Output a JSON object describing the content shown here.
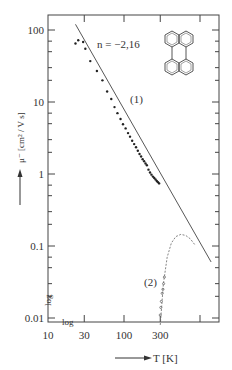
{
  "chart_data": {
    "type": "scatter",
    "title": "",
    "xlabel": "T [K]",
    "ylabel": "μ⁻ [cm² / V s]",
    "xscale": "log",
    "yscale": "log",
    "xlim": [
      10,
      1500
    ],
    "ylim": [
      0.006,
      180
    ],
    "x_ticks": [
      10,
      30,
      100,
      300
    ],
    "x_tick_labels": [
      "10",
      "30",
      "100",
      "300"
    ],
    "y_ticks": [
      0.01,
      0.1,
      1,
      10,
      100
    ],
    "y_tick_labels": [
      "0.01",
      "0.1",
      "1",
      "10",
      "100"
    ],
    "x_axis_tag": "log",
    "y_axis_tag": "log",
    "grid": false,
    "annotations": [
      {
        "text": "n = −2,16",
        "note": "power-law fit exponent"
      },
      {
        "text": "(1)",
        "note": "series 1 label"
      },
      {
        "text": "(2)",
        "note": "series 2 label"
      },
      {
        "text": "perylene structure",
        "note": "molecular structure inset, top right"
      }
    ],
    "series": [
      {
        "name": "(1)",
        "marker": "filled-dot",
        "x": [
          23,
          25,
          29,
          31,
          36,
          44,
          52,
          60,
          68,
          75,
          82,
          90,
          97,
          105,
          113,
          120,
          128,
          136,
          144,
          152,
          160,
          168,
          176,
          184,
          192,
          200,
          210,
          220,
          230,
          240,
          250,
          260,
          270,
          280,
          290
        ],
        "y": [
          65,
          72,
          68,
          55,
          37,
          27,
          20,
          14,
          11,
          8.5,
          7,
          5.8,
          4.9,
          4.3,
          3.7,
          3.3,
          2.9,
          2.6,
          2.35,
          2.1,
          1.9,
          1.75,
          1.6,
          1.5,
          1.4,
          1.32,
          1.15,
          1.05,
          0.98,
          0.92,
          0.88,
          0.84,
          0.8,
          0.77,
          0.74
        ]
      },
      {
        "name": "fit line n = -2.16",
        "style": "solid-line",
        "x": [
          23,
          1400
        ],
        "y": [
          120,
          0.06
        ]
      },
      {
        "name": "(2)",
        "marker": "open-circle",
        "style": "dashed-line",
        "x": [
          300,
          305,
          310,
          318,
          325,
          332,
          340
        ],
        "y": [
          0.011,
          0.014,
          0.017,
          0.022,
          0.025,
          0.03,
          0.037
        ]
      },
      {
        "name": "(2) dashed trend",
        "style": "dashed-line",
        "x": [
          300,
          330,
          370,
          420,
          480,
          560,
          650,
          750,
          850
        ],
        "y": [
          0.008,
          0.03,
          0.07,
          0.11,
          0.135,
          0.145,
          0.14,
          0.125,
          0.105
        ]
      }
    ]
  },
  "labels": {
    "y_axis": "μ⁻ [cm² / V s]",
    "x_axis": "T [K]",
    "n_annotation": "n = −2,16",
    "series1": "(1)",
    "series2": "(2)",
    "log_x": "log",
    "log_y": "log",
    "yticks": [
      "100",
      "10",
      "1",
      "0.1",
      "0.01"
    ],
    "xticks": [
      "10",
      "30",
      "100",
      "300"
    ]
  }
}
